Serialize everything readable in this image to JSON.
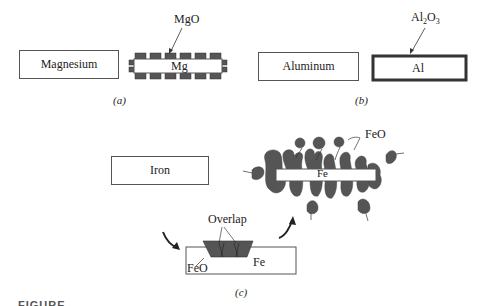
{
  "panel_a": {
    "metal_label": "Magnesium",
    "oxidized_label": "Mg",
    "oxide_label": "MgO",
    "caption": "(a)"
  },
  "panel_b": {
    "metal_label": "Aluminum",
    "oxidized_label": "Al",
    "oxide_label_main": "Al",
    "oxide_label_sub1": "2",
    "oxide_label_o": "O",
    "oxide_label_sub2": "3",
    "caption": "(b)"
  },
  "panel_c": {
    "metal_label": "Iron",
    "overlap_label": "Overlap",
    "oxide_small_label": "FeO",
    "metal_small_label": "Fe",
    "spalled_metal_label": "Fe",
    "spalled_oxide_label": "FeO",
    "caption": "(c)"
  },
  "figure_caption": "FIGURE"
}
